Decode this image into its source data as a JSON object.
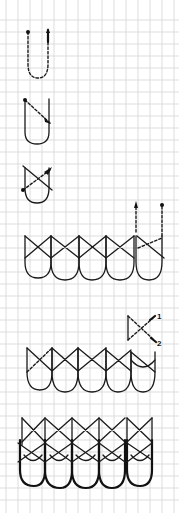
{
  "diagram": {
    "type": "hand-drawn stitch diagram on graph paper",
    "background": "#ffffff",
    "grid_color": "#d4d4d4",
    "ink_color": "#1a1a1a",
    "grid_spacing_px": 12,
    "steps": [
      {
        "id": "step-1",
        "description": "Single dashed U-loop with start dot and upward arrow"
      },
      {
        "id": "step-2",
        "description": "Solid U-loop with dashed diagonal arrow crossing"
      },
      {
        "id": "step-3",
        "description": "U-loop with crossed X diagonals"
      },
      {
        "id": "step-4",
        "description": "Row of five crossed loops with dashed continuation arrows"
      },
      {
        "id": "step-5",
        "description": "Row of crossed loops with numbered crossing detail"
      },
      {
        "id": "step-6",
        "description": "Completed dense layered pattern of crossed loops"
      }
    ],
    "labels": {
      "marker_1": "1",
      "marker_2": "2"
    }
  }
}
